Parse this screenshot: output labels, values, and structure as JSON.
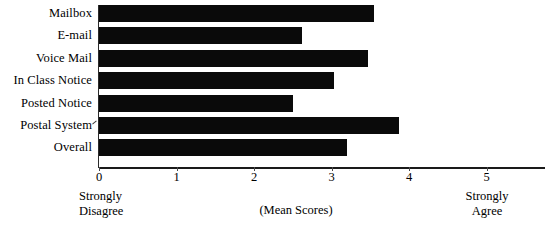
{
  "chart_data": {
    "type": "bar",
    "orientation": "horizontal",
    "title": "",
    "subtitle": "",
    "xlabel": "(Mean Scores)",
    "ylabel": "",
    "categories": [
      "Mailbox",
      "E-mail",
      "Voice Mail",
      "In Class Notice",
      "Posted Notice",
      "Postal System",
      "Overall"
    ],
    "values": [
      3.55,
      2.62,
      3.47,
      3.03,
      2.5,
      3.87,
      3.2
    ],
    "xlim": [
      0,
      5
    ],
    "ylim": null,
    "xticks": [
      0,
      1,
      2,
      3,
      4,
      5
    ],
    "xtick_labels": [
      "0",
      "1",
      "2",
      "3",
      "4",
      "5"
    ],
    "grid": false,
    "legend": null,
    "legend_position": "none",
    "bar_color": "#0a0a0a",
    "annotations": [
      {
        "text": "Strongly\nDisagree",
        "at_x": 0,
        "position": "below-axis-left"
      },
      {
        "text": "Strongly\nAgree",
        "at_x": 5,
        "position": "below-axis-right"
      },
      {
        "text": "(Mean Scores)",
        "position": "below-axis-center"
      }
    ],
    "scale_anchor_low_line1": "Strongly",
    "scale_anchor_low_line2": "Disagree",
    "scale_anchor_high_line1": "Strongly",
    "scale_anchor_high_line2": "Agree"
  },
  "axis": {
    "title": "(Mean Scores)",
    "ticks": [
      {
        "label": "0",
        "value": 0
      },
      {
        "label": "1",
        "value": 1
      },
      {
        "label": "2",
        "value": 2
      },
      {
        "label": "3",
        "value": 3
      },
      {
        "label": "4",
        "value": 4
      },
      {
        "label": "5",
        "value": 5
      }
    ]
  },
  "anchors": {
    "low": {
      "line1": "Strongly",
      "line2": "Disagree"
    },
    "high": {
      "line1": "Strongly",
      "line2": "Agree"
    }
  },
  "colors": {
    "bar": "#0a0a0a",
    "axis": "#1a1a1a",
    "text": "#000000",
    "background": "#ffffff"
  }
}
